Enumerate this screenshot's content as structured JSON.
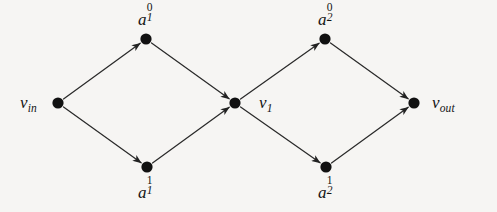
{
  "figure": {
    "type": "directed-graph",
    "background_color": "#f6f5f3",
    "edge_color": "#2a2a2a",
    "node_color": "#111111",
    "node_radius": 5.6,
    "canvas": {
      "width": 497,
      "height": 212
    }
  },
  "nodes": [
    {
      "id": "v_in",
      "name": "v-in-node",
      "x": 58,
      "y": 103,
      "base": "v",
      "sub": "in",
      "sup": "",
      "label_text": "v_in",
      "label_x": 20,
      "label_y": 94,
      "label_align": "left"
    },
    {
      "id": "a_1_0",
      "name": "a-1-0-node",
      "x": 146,
      "y": 39,
      "base": "a",
      "sub": "1",
      "sup": "0",
      "label_text": "a_1^0",
      "label_x": 138,
      "label_y": 8,
      "label_align": "left"
    },
    {
      "id": "a_1_1",
      "name": "a-1-1-node",
      "x": 147,
      "y": 167,
      "base": "a",
      "sub": "1",
      "sup": "1",
      "label_text": "a_1^1",
      "label_x": 138,
      "label_y": 181,
      "label_align": "left"
    },
    {
      "id": "v_1",
      "name": "v-1-node",
      "x": 235,
      "y": 103,
      "base": "v",
      "sub": "1",
      "sup": "",
      "label_text": "v_1",
      "label_x": 259,
      "label_y": 94,
      "label_align": "left"
    },
    {
      "id": "a_2_0",
      "name": "a-2-0-node",
      "x": 325,
      "y": 39,
      "base": "a",
      "sub": "2",
      "sup": "0",
      "label_text": "a_2^0",
      "label_x": 318,
      "label_y": 8,
      "label_align": "left"
    },
    {
      "id": "a_2_1",
      "name": "a-2-1-node",
      "x": 326,
      "y": 167,
      "base": "a",
      "sub": "2",
      "sup": "1",
      "label_text": "a_2^1",
      "label_x": 318,
      "label_y": 181,
      "label_align": "left"
    },
    {
      "id": "v_out",
      "name": "v-out-node",
      "x": 414,
      "y": 103,
      "base": "v",
      "sub": "out",
      "sup": "",
      "label_text": "v_out",
      "label_x": 432,
      "label_y": 94,
      "label_align": "left"
    }
  ],
  "edges": [
    {
      "id": "e1",
      "name": "edge-vin-to-a10",
      "from": "v_in",
      "to": "a_1_0",
      "arrow": true
    },
    {
      "id": "e2",
      "name": "edge-vin-to-a11",
      "from": "v_in",
      "to": "a_1_1",
      "arrow": true
    },
    {
      "id": "e3",
      "name": "edge-a10-to-v1",
      "from": "a_1_0",
      "to": "v_1",
      "arrow": true
    },
    {
      "id": "e4",
      "name": "edge-a11-to-v1",
      "from": "a_1_1",
      "to": "v_1",
      "arrow": true
    },
    {
      "id": "e5",
      "name": "edge-v1-to-a20",
      "from": "v_1",
      "to": "a_2_0",
      "arrow": true
    },
    {
      "id": "e6",
      "name": "edge-v1-to-a21",
      "from": "v_1",
      "to": "a_2_1",
      "arrow": true
    },
    {
      "id": "e7",
      "name": "edge-a20-to-vout",
      "from": "a_2_0",
      "to": "v_out",
      "arrow": true
    },
    {
      "id": "e8",
      "name": "edge-a21-to-vout",
      "from": "a_2_1",
      "to": "v_out",
      "arrow": true
    }
  ]
}
